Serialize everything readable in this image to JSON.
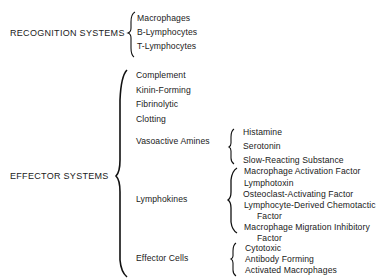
{
  "diagram": {
    "recognition": {
      "label": "RECOGNITION SYSTEMS",
      "items": [
        "Macrophages",
        "B-Lymphocytes",
        "T-Lymphocytes"
      ]
    },
    "effector": {
      "label": "EFFECTOR SYSTEMS",
      "items": [
        {
          "label": "Complement"
        },
        {
          "label": "Kinin-Forming"
        },
        {
          "label": "Fibrinolytic"
        },
        {
          "label": "Clotting"
        },
        {
          "label": "Vasoactive Amines",
          "children": [
            "Histamine",
            "Serotonin",
            "Slow-Reacting Substance"
          ]
        },
        {
          "label": "Lymphokines",
          "children": [
            "Macrophage Activation Factor",
            "Lymphotoxin",
            "Osteoclast-Activating Factor",
            "Lymphocyte-Derived Chemotactic",
            "Factor",
            "Macrophage Migration Inhibitory",
            "Factor"
          ]
        },
        {
          "label": "Effector Cells",
          "children": [
            "Cytotoxic",
            "Antibody Forming",
            "Activated Macrophages"
          ]
        }
      ]
    }
  }
}
